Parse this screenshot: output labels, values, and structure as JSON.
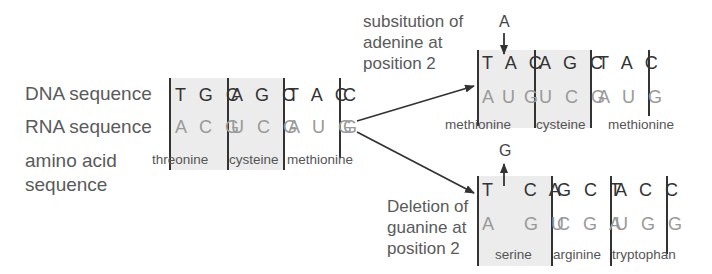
{
  "left": {
    "labels": {
      "dna": "DNA sequence",
      "rna": "RNA sequence",
      "amino1": "amino acid",
      "amino2": "sequence"
    },
    "dna_codons": [
      "T G C",
      "A G C",
      "T A C",
      "C"
    ],
    "rna_codons": [
      "A C G",
      "U C G",
      "A U G",
      "G"
    ],
    "amino_acids": [
      "threonine",
      "cysteine",
      "methionine"
    ]
  },
  "substitution": {
    "label_lines": [
      "subsitution of",
      "adenine at",
      "position 2"
    ],
    "inserted_base": "A",
    "dna_codons": [
      "T A C",
      "A G C",
      "T A C"
    ],
    "rna_codons": [
      "A U G",
      "U C G",
      "A U G"
    ],
    "amino_acids": [
      "methionine",
      "cysteine",
      "methionine"
    ]
  },
  "deletion": {
    "label_lines": [
      "Deletion of",
      "guanine at",
      "position 2"
    ],
    "removed_base": "G",
    "dna_codons": [
      "T   C A",
      "G C T",
      "A C C"
    ],
    "rna_codons": [
      "A   G U",
      "C G A",
      "U G G"
    ],
    "amino_acids": [
      "serine",
      "arginine",
      "tryptophan"
    ]
  },
  "colors": {
    "shade": "#ececec",
    "line": "#333333",
    "dna_text": "#333333",
    "rna_text": "#999999"
  }
}
